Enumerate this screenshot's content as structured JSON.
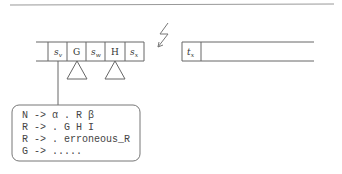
{
  "stack": {
    "cells": [
      {
        "label": "s",
        "sub": "v",
        "italic": true
      },
      {
        "label": "G",
        "sub": "",
        "italic": false
      },
      {
        "label": "s",
        "sub": "w",
        "italic": true
      },
      {
        "label": "H",
        "sub": "",
        "italic": false
      },
      {
        "label": "s",
        "sub": "x",
        "italic": true
      }
    ]
  },
  "input": {
    "cell": {
      "label": "t",
      "sub": "x"
    }
  },
  "rules": [
    "N -> α . R β",
    "R -> . G H I",
    "R -> . erroneous_R",
    "G -> ....."
  ],
  "icons": {
    "error": "lightning-bolt-icon"
  }
}
